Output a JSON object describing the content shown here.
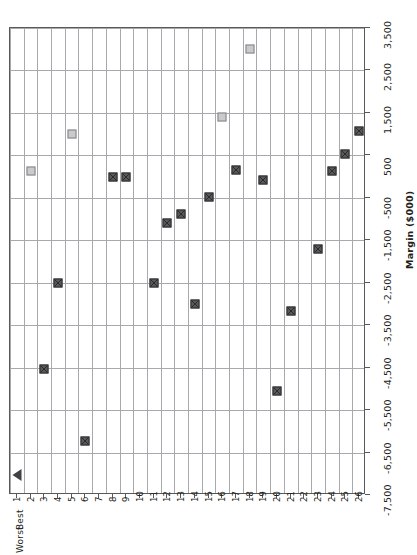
{
  "chart_data": {
    "type": "scatter",
    "title": "",
    "orientation": "rotated-90",
    "xlabel": "Rank",
    "ylabel": "Margin ($000)",
    "x_axis": {
      "label": "Rank",
      "ticks": [
        1,
        2,
        3,
        4,
        5,
        6,
        7,
        8,
        9,
        10,
        11,
        12,
        13,
        14,
        15,
        16,
        17,
        18,
        19,
        20,
        21,
        22,
        23,
        24,
        25,
        26
      ],
      "tick_labels": [
        "1",
        "2",
        "3",
        "4",
        "5",
        "6",
        "7",
        "8",
        "9",
        "10",
        "11",
        "12",
        "13",
        "14",
        "15",
        "16",
        "17",
        "18",
        "19",
        "20",
        "21",
        "22",
        "23",
        "24",
        "25",
        "26"
      ],
      "end_label_low": "Best",
      "end_label_high": "Worst",
      "range": [
        1,
        26
      ]
    },
    "y_axis": {
      "label": "Margin ($000)",
      "ticks": [
        -7500,
        -6500,
        -5500,
        -4500,
        -3500,
        -2500,
        -1500,
        -500,
        500,
        1500,
        2500,
        3500
      ],
      "tick_labels": [
        "-7,500",
        "-6,500",
        "-5,500",
        "-4,500",
        "-3,500",
        "-2,500",
        "-1,500",
        "-500",
        "500",
        "1,500",
        "2,500",
        "3,500"
      ],
      "range": [
        -7500,
        3500
      ],
      "grid": true,
      "zero_line": 0
    },
    "legend": [],
    "series": [
      {
        "name": "Margin by rank",
        "marker_kinds": [
          "triangle",
          "light-square",
          "dark-square"
        ],
        "points": [
          {
            "rank": 1,
            "margin": -7040,
            "marker": "triangle"
          },
          {
            "rank": 2,
            "margin": 130,
            "marker": "light-square"
          },
          {
            "rank": 3,
            "margin": -4530,
            "marker": "dark-square"
          },
          {
            "rank": 4,
            "margin": -2500,
            "marker": "dark-square"
          },
          {
            "rank": 5,
            "margin": 1000,
            "marker": "light-square"
          },
          {
            "rank": 6,
            "margin": -6220,
            "marker": "dark-square"
          },
          {
            "rank": 8,
            "margin": -10,
            "marker": "dark-square"
          },
          {
            "rank": 9,
            "margin": 0,
            "marker": "dark-square"
          },
          {
            "rank": 11,
            "margin": -2500,
            "marker": "dark-square"
          },
          {
            "rank": 12,
            "margin": -1100,
            "marker": "dark-square"
          },
          {
            "rank": 13,
            "margin": -870,
            "marker": "dark-square"
          },
          {
            "rank": 14,
            "margin": -3000,
            "marker": "dark-square"
          },
          {
            "rank": 15,
            "margin": -480,
            "marker": "dark-square"
          },
          {
            "rank": 16,
            "margin": 1400,
            "marker": "light-square"
          },
          {
            "rank": 17,
            "margin": 160,
            "marker": "dark-square"
          },
          {
            "rank": 18,
            "margin": 3000,
            "marker": "light-square"
          },
          {
            "rank": 19,
            "margin": -90,
            "marker": "dark-square"
          },
          {
            "rank": 20,
            "margin": -5050,
            "marker": "dark-square"
          },
          {
            "rank": 21,
            "margin": -3160,
            "marker": "dark-square"
          },
          {
            "rank": 23,
            "margin": -1700,
            "marker": "dark-square"
          },
          {
            "rank": 24,
            "margin": 120,
            "marker": "dark-square"
          },
          {
            "rank": 25,
            "margin": 540,
            "marker": "dark-square"
          },
          {
            "rank": 26,
            "margin": 1080,
            "marker": "dark-square"
          }
        ]
      }
    ]
  },
  "colors": {
    "dark_marker": "#58595b",
    "light_marker": "#c9cacc",
    "gridline": "#a7a9ac",
    "axis": "#58595b",
    "text": "#231f20"
  }
}
